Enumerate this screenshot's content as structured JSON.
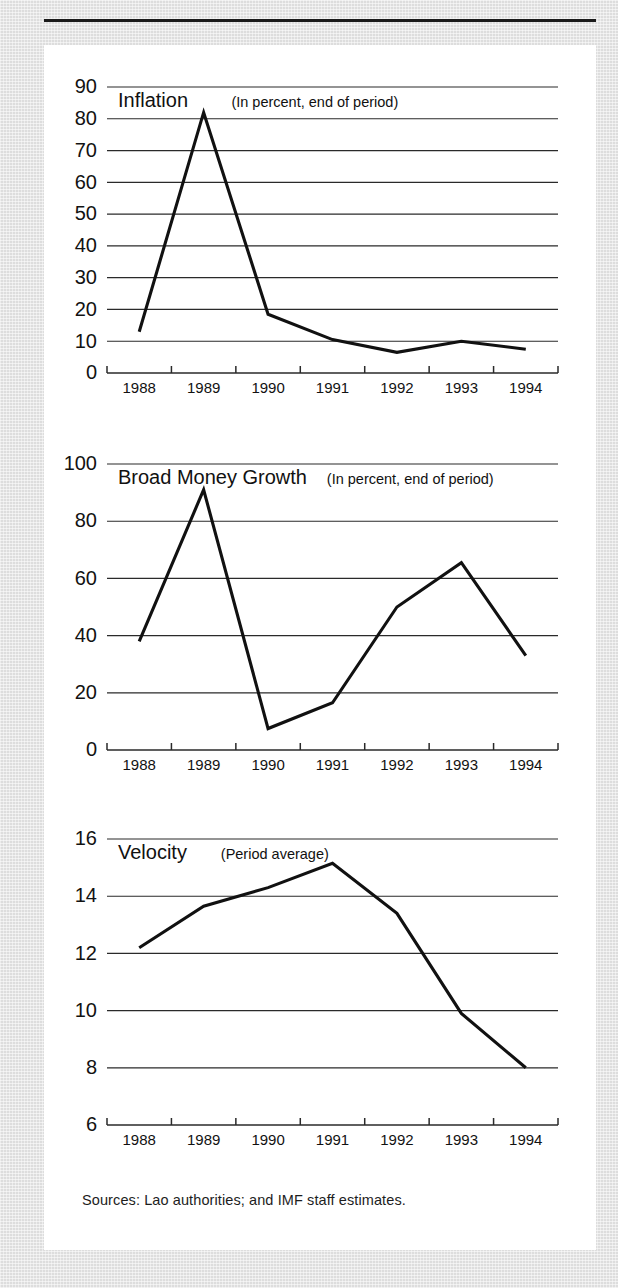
{
  "figure": {
    "source_note": "Sources: Lao authorities; and IMF staff estimates."
  },
  "chart_data": [
    {
      "type": "line",
      "id": "inflation",
      "title": "Inflation",
      "subtitle": "(In percent, end of period)",
      "xlabel": "",
      "ylabel": "",
      "categories": [
        "1988",
        "1989",
        "1990",
        "1991",
        "1992",
        "1993",
        "1994"
      ],
      "values": [
        13,
        82,
        18.5,
        10.5,
        6.5,
        10,
        7.5
      ],
      "ylim": [
        0,
        90
      ],
      "yticks": [
        0,
        10,
        20,
        30,
        40,
        50,
        60,
        70,
        80,
        90
      ],
      "ytick_labels": [
        "0",
        "10",
        "20",
        "30",
        "40",
        "50",
        "60",
        "70",
        "80",
        "90"
      ],
      "grid": true,
      "legend": "none"
    },
    {
      "type": "line",
      "id": "broad-money-growth",
      "title": "Broad Money Growth",
      "subtitle": "(In percent, end of period)",
      "xlabel": "",
      "ylabel": "",
      "categories": [
        "1988",
        "1989",
        "1990",
        "1991",
        "1992",
        "1993",
        "1994"
      ],
      "values": [
        38,
        91,
        7.5,
        16.5,
        50,
        65.5,
        33
      ],
      "ylim": [
        0,
        100
      ],
      "yticks": [
        0,
        20,
        40,
        60,
        80,
        100
      ],
      "ytick_labels": [
        "0",
        "20",
        "40",
        "60",
        "80",
        "100"
      ],
      "grid": true,
      "legend": "none"
    },
    {
      "type": "line",
      "id": "velocity",
      "title": "Velocity",
      "subtitle": "(Period average)",
      "xlabel": "",
      "ylabel": "",
      "categories": [
        "1988",
        "1989",
        "1990",
        "1991",
        "1992",
        "1993",
        "1994"
      ],
      "values": [
        12.2,
        13.65,
        14.3,
        15.15,
        13.4,
        9.9,
        8.0
      ],
      "ylim": [
        6,
        16
      ],
      "yticks": [
        6,
        8,
        10,
        12,
        14,
        16
      ],
      "ytick_labels": [
        "6",
        "8",
        "10",
        "12",
        "14",
        "16"
      ],
      "grid": true,
      "legend": "none"
    }
  ]
}
